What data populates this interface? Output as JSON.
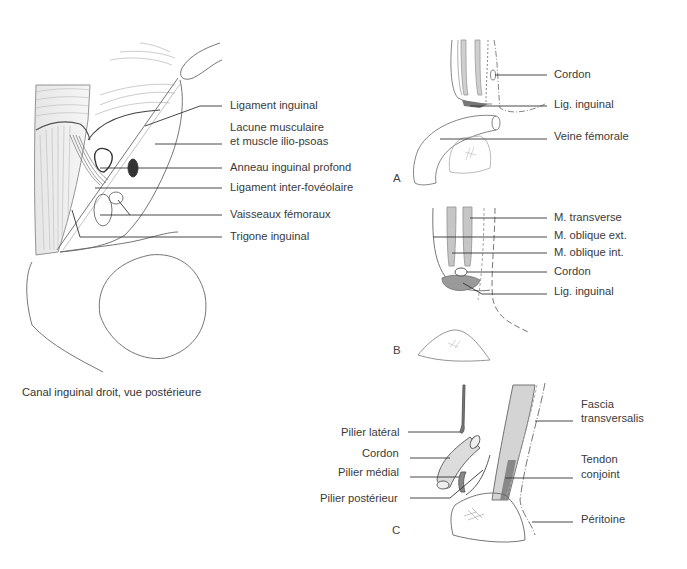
{
  "main_figure": {
    "caption": "Canal inguinal droit, vue postérieure",
    "labels": [
      {
        "id": "ligament-inguinal",
        "text": "Ligament inguinal"
      },
      {
        "id": "lacune-musculaire-1",
        "text": "Lacune musculaire"
      },
      {
        "id": "lacune-musculaire-2",
        "text": "et muscle ilio-psoas"
      },
      {
        "id": "anneau-inguinal-profond",
        "text": "Anneau inguinal profond"
      },
      {
        "id": "ligament-inter-foveolaire",
        "text": "Ligament inter-fovéolaire"
      },
      {
        "id": "vaisseaux-femoraux",
        "text": "Vaisseaux fémoraux"
      },
      {
        "id": "trigone-inguinal",
        "text": "Trigone inguinal"
      }
    ]
  },
  "panel_a": {
    "letter": "A",
    "labels": [
      {
        "id": "cordon",
        "text": "Cordon"
      },
      {
        "id": "lig-inguinal",
        "text": "Lig. inguinal"
      },
      {
        "id": "veine-femorale",
        "text": "Veine fémorale"
      }
    ]
  },
  "panel_b": {
    "letter": "B",
    "labels": [
      {
        "id": "m-transverse",
        "text": "M. transverse"
      },
      {
        "id": "m-oblique-ext",
        "text": "M. oblique ext."
      },
      {
        "id": "m-oblique-int",
        "text": "M. oblique int."
      },
      {
        "id": "cordon",
        "text": "Cordon"
      },
      {
        "id": "lig-inguinal",
        "text": "Lig. inguinal"
      }
    ]
  },
  "panel_c": {
    "letter": "C",
    "left_labels": [
      {
        "id": "pilier-lateral",
        "text": "Pilier latéral"
      },
      {
        "id": "cordon",
        "text": "Cordon"
      },
      {
        "id": "pilier-medial",
        "text": "Pilier médial"
      },
      {
        "id": "pilier-posterieur",
        "text": "Pilier postérieur"
      }
    ],
    "right_labels": [
      {
        "id": "fascia-1",
        "text": "Fascia"
      },
      {
        "id": "fascia-2",
        "text": "transversalis"
      },
      {
        "id": "tendon-1",
        "text": "Tendon"
      },
      {
        "id": "tendon-2",
        "text": "conjoint"
      },
      {
        "id": "peritoine",
        "text": "Péritoine"
      }
    ]
  },
  "colors": {
    "line": "#555555",
    "leader": "#333333",
    "muscle_shade": "#b8b8b8",
    "dark_fill": "#3a3a3a"
  }
}
